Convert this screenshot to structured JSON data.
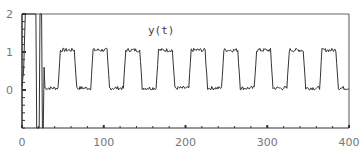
{
  "chart_data": {
    "type": "line",
    "title": "y(t)",
    "xlabel": "",
    "ylabel": "",
    "xlim": [
      0,
      400
    ],
    "ylim": [
      -1,
      2
    ],
    "xticks": [
      0,
      100,
      200,
      300,
      400
    ],
    "yticks": [
      0,
      1,
      2
    ],
    "x_minor_step": 20,
    "y_minor_step": 0.2,
    "grid": false,
    "legend": "none",
    "series": [
      {
        "name": "y(t)",
        "description": "Initial large transient (t 0-27) then noisy square wave between ~0.05 and ~1.05 with period ~40",
        "transient": [
          [
            0,
            0.1
          ],
          [
            2,
            0.5
          ],
          [
            4,
            2.0
          ],
          [
            17,
            2.0
          ],
          [
            18,
            -1.0
          ],
          [
            21,
            -1.0
          ],
          [
            22,
            2.0
          ],
          [
            24,
            2.0
          ],
          [
            25,
            -1.0
          ],
          [
            26,
            -1.0
          ],
          [
            27,
            0.6
          ],
          [
            28,
            0.1
          ]
        ],
        "square_wave": {
          "low": 0.05,
          "high": 1.05,
          "period": 40,
          "first_rise": 44,
          "high_duration": 20,
          "start": 28,
          "end": 400,
          "noise": 0.05
        }
      }
    ]
  }
}
